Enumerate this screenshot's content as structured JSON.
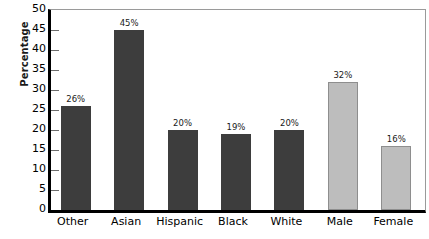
{
  "chart_data": {
    "type": "bar",
    "title": "",
    "xlabel": "",
    "ylabel": "Percentage",
    "ylim": [
      0,
      50
    ],
    "ytick_step": 5,
    "yticks": [
      50,
      45,
      40,
      35,
      30,
      25,
      20,
      15,
      10,
      5,
      0
    ],
    "ytick_labels": [
      "50",
      "45",
      "40",
      "35",
      "30",
      "25",
      "20",
      "15",
      "10",
      "5",
      "0"
    ],
    "categories": [
      "Other",
      "Asian",
      "Hispanic",
      "Black",
      "White",
      "Male",
      "Female"
    ],
    "values": [
      26,
      45,
      20,
      19,
      20,
      32,
      16
    ],
    "data_labels": [
      "26%",
      "45%",
      "20%",
      "19%",
      "20%",
      "32%",
      "16%"
    ],
    "bar_colors": [
      "#3d3d3d",
      "#3d3d3d",
      "#3d3d3d",
      "#3d3d3d",
      "#3d3d3d",
      "#bdbdbd",
      "#bdbdbd"
    ],
    "grid": false,
    "legend": null,
    "groups": [
      {
        "name": "Race/Ethnicity",
        "color": "#3d3d3d",
        "categories": [
          "Other",
          "Asian",
          "Hispanic",
          "Black",
          "White"
        ]
      },
      {
        "name": "Gender",
        "color": "#bdbdbd",
        "categories": [
          "Male",
          "Female"
        ]
      }
    ]
  },
  "colors": {
    "dark_bar": "#3d3d3d",
    "light_bar": "#bdbdbd",
    "axis": "#000000",
    "frame": "#9a9a9a",
    "text": "#000000",
    "background": "#ffffff"
  }
}
